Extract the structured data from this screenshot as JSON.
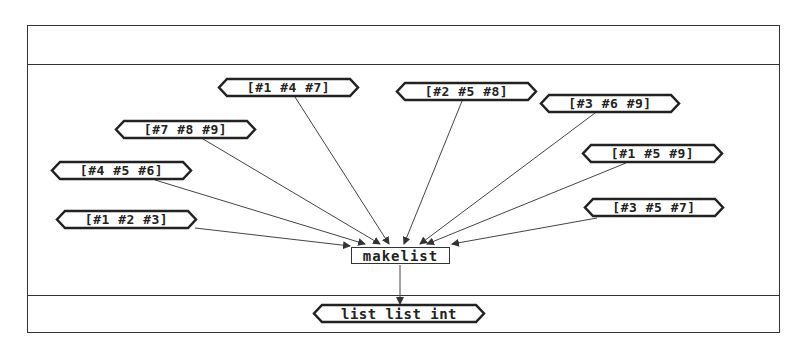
{
  "diagram": {
    "function_node": {
      "label": "makelist"
    },
    "output_node": {
      "label": "list list int"
    },
    "input_nodes": [
      {
        "label": "[#1 #4 #7]"
      },
      {
        "label": "[#2 #5 #8]"
      },
      {
        "label": "[#3 #6 #9]"
      },
      {
        "label": "[#7 #8 #9]"
      },
      {
        "label": "[#1 #5 #9]"
      },
      {
        "label": "[#4 #5 #6]"
      },
      {
        "label": "[#1 #2 #3]"
      },
      {
        "label": "[#3 #5 #7]"
      }
    ],
    "colors": {
      "stroke": "#333333",
      "text": "#222222",
      "background": "#ffffff"
    }
  }
}
